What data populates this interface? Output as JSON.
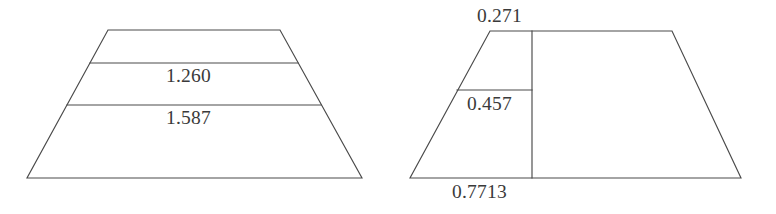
{
  "figure": {
    "background_color": "#ffffff",
    "line_color": "#4a4a4a",
    "text_color": "#3a3a3a",
    "panels": [
      {
        "name": "left-trapezoid",
        "description": "Trapezoid divided by two horizontal lines into three horizontal bands",
        "labels": [
          {
            "name": "upper-band-value",
            "text": "1.260"
          },
          {
            "name": "lower-band-value",
            "text": "1.587"
          }
        ]
      },
      {
        "name": "right-trapezoid",
        "description": "Trapezoid with a vertical line near the left and a short horizontal line forming a small cell",
        "labels": [
          {
            "name": "top-value",
            "text": "0.271"
          },
          {
            "name": "middle-value",
            "text": "0.457"
          },
          {
            "name": "bottom-value",
            "text": "0.7713"
          }
        ]
      }
    ]
  },
  "labels": {
    "left_upper": "1.260",
    "left_lower": "1.587",
    "right_top": "0.271",
    "right_mid": "0.457",
    "right_bottom": "0.7713"
  }
}
